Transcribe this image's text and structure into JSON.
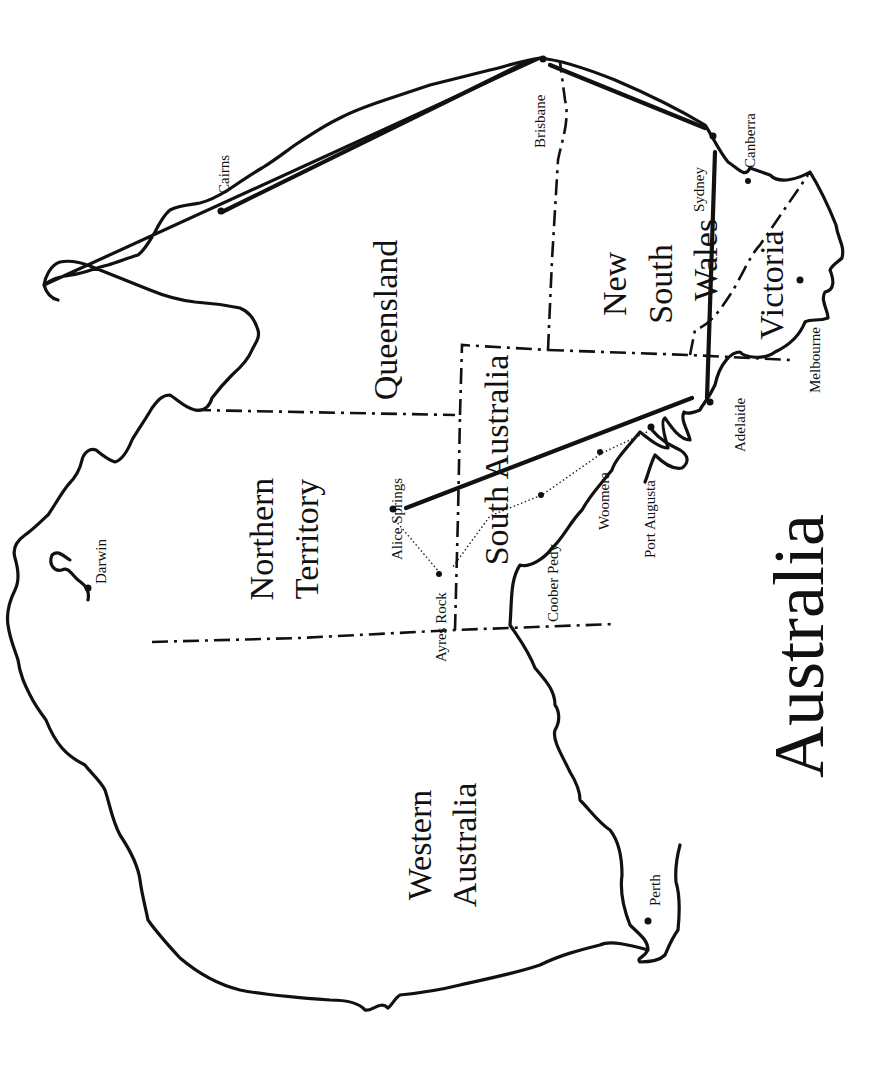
{
  "map": {
    "title": "Australia",
    "orientation": "rotated 90 degrees clockwise (north at right)",
    "states": [
      {
        "name": "Queensland",
        "lines": [
          "Queensland"
        ]
      },
      {
        "name": "New South Wales",
        "lines": [
          "New",
          "South",
          "Wales"
        ]
      },
      {
        "name": "Victoria",
        "lines": [
          "Victoria"
        ]
      },
      {
        "name": "South Australia",
        "lines": [
          "South Australia"
        ]
      },
      {
        "name": "Northern Territory",
        "lines": [
          "Northern",
          "Territory"
        ]
      },
      {
        "name": "Western Australia",
        "lines": [
          "Western",
          "Australia"
        ]
      }
    ],
    "cities": [
      {
        "name": "Cairns"
      },
      {
        "name": "Brisbane"
      },
      {
        "name": "Sydney"
      },
      {
        "name": "Canberra"
      },
      {
        "name": "Melbourne"
      },
      {
        "name": "Adelaide"
      },
      {
        "name": "Port Augusta"
      },
      {
        "name": "Woomera"
      },
      {
        "name": "Coober Pedy"
      },
      {
        "name": "Alice Springs"
      },
      {
        "name": "Ayres Rock"
      },
      {
        "name": "Darwin"
      },
      {
        "name": "Perth"
      }
    ],
    "routes": {
      "solid": [
        "Cairns–Brisbane",
        "Brisbane–Sydney",
        "Sydney–Adelaide",
        "Adelaide–Alice Springs"
      ],
      "dotted": [
        "Port Augusta–Woomera–Coober Pedy–Ayres Rock",
        "Alice Springs–Ayres Rock"
      ]
    }
  }
}
